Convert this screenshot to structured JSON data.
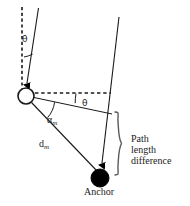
{
  "figure": {
    "name": "path-length-difference-geometry-diagram",
    "width": 190,
    "height": 206,
    "background_color": "#ffffff",
    "stroke_color": "#1a1a1a",
    "fill_color": "#000000"
  },
  "labels": {
    "theta_top": "θ",
    "theta_mid": "θ",
    "alpha_symbol": "α",
    "alpha_sub": "m",
    "d_symbol": "d",
    "d_sub": "m",
    "anchor": "Anchor",
    "path_line1": "Path",
    "path_line2": "length",
    "path_line3": "difference"
  },
  "nodes": [
    {
      "id": "mobile-node",
      "shape": "circle-open",
      "cx": 26,
      "cy": 96,
      "r": 8,
      "fill": "#ffffff",
      "stroke": "#1a1a1a"
    },
    {
      "id": "anchor-node",
      "shape": "circle-filled",
      "cx": 100,
      "cy": 178,
      "r": 9,
      "fill": "#000000",
      "stroke": "#000000"
    }
  ],
  "rays": [
    {
      "id": "incoming-ray-left",
      "from": [
        38,
        8
      ],
      "to": [
        26,
        88
      ],
      "style": "solid",
      "arrowhead": true
    },
    {
      "id": "incoming-ray-right",
      "from": [
        119,
        17
      ],
      "to": [
        101,
        168
      ],
      "style": "solid",
      "arrowhead": true
    },
    {
      "id": "vertical-reference-dashed",
      "from": [
        22,
        8
      ],
      "to": [
        22,
        88
      ],
      "style": "dashed",
      "arrowhead": false
    },
    {
      "id": "horizontal-reference-dashed",
      "from": [
        34,
        93
      ],
      "to": [
        110,
        93
      ],
      "style": "dashed",
      "arrowhead": false
    },
    {
      "id": "baseline-to-right-ray",
      "from": [
        34,
        97
      ],
      "to": [
        110,
        113
      ],
      "style": "solid",
      "arrowhead": false
    },
    {
      "id": "distance-segment-dm",
      "from": [
        31,
        103
      ],
      "to": [
        96,
        170
      ],
      "style": "solid",
      "arrowhead": false
    }
  ],
  "arcs": [
    {
      "id": "theta-arc-top",
      "center": [
        26,
        88
      ],
      "radius": 30,
      "label": "theta_top"
    },
    {
      "id": "theta-arc-mid",
      "center": [
        26,
        96
      ],
      "radius": 52,
      "label": "theta_mid"
    },
    {
      "id": "alpha-arc",
      "center": [
        26,
        96
      ],
      "radius": 30,
      "label": "alpha_m"
    }
  ],
  "brace": {
    "id": "path-length-difference-brace",
    "x": 116,
    "y_top": 112,
    "y_bottom": 176,
    "tip_x": 126,
    "orientation": "right-pointing"
  }
}
